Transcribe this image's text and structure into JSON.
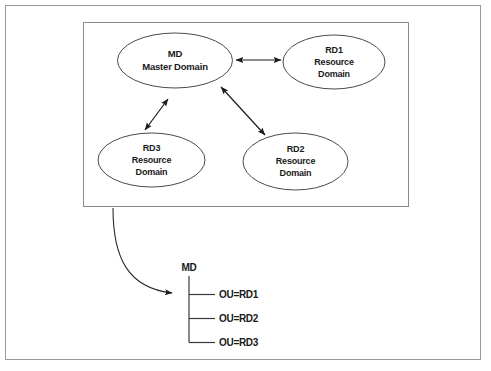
{
  "figure": {
    "title": "",
    "nodes": [
      {
        "id": "md",
        "lines": [
          "MD",
          "Master Domain"
        ],
        "line1": "MD",
        "line2": "Master Domain",
        "line3": ""
      },
      {
        "id": "rd1",
        "lines": [
          "RD1",
          "Resource",
          "Domain"
        ],
        "line1": "RD1",
        "line2": "Resource",
        "line3": "Domain"
      },
      {
        "id": "rd2",
        "lines": [
          "RD2",
          "Resource",
          "Domain"
        ],
        "line1": "RD2",
        "line2": "Resource",
        "line3": "Domain"
      },
      {
        "id": "rd3",
        "lines": [
          "RD3",
          "Resource",
          "Domain"
        ],
        "line1": "RD3",
        "line2": "Resource",
        "line3": "Domain"
      }
    ],
    "connectors": [
      {
        "id": "md-rd1",
        "from": "md",
        "to": "rd1",
        "style": "double-arrow"
      },
      {
        "id": "md-rd2",
        "from": "md",
        "to": "rd2",
        "style": "double-arrow"
      },
      {
        "id": "md-rd3",
        "from": "md",
        "to": "rd3",
        "style": "double-arrow"
      }
    ],
    "mapping_arrow": {
      "id": "domain-to-ou-arrow",
      "style": "curved-arrow"
    },
    "tree": {
      "root": "MD",
      "children": [
        {
          "label": "OU=RD1"
        },
        {
          "label": "OU=RD2"
        },
        {
          "label": "OU=RD3"
        }
      ],
      "child_0": "OU=RD1",
      "child_1": "OU=RD2",
      "child_2": "OU=RD3"
    },
    "colors": {
      "frame": "#9a9a9a",
      "box": "#8c8c8c",
      "ellipse_stroke": "#4a4a4a",
      "line": "#1a1a1a",
      "text": "#1a1a1a",
      "background": "#ffffff"
    }
  }
}
